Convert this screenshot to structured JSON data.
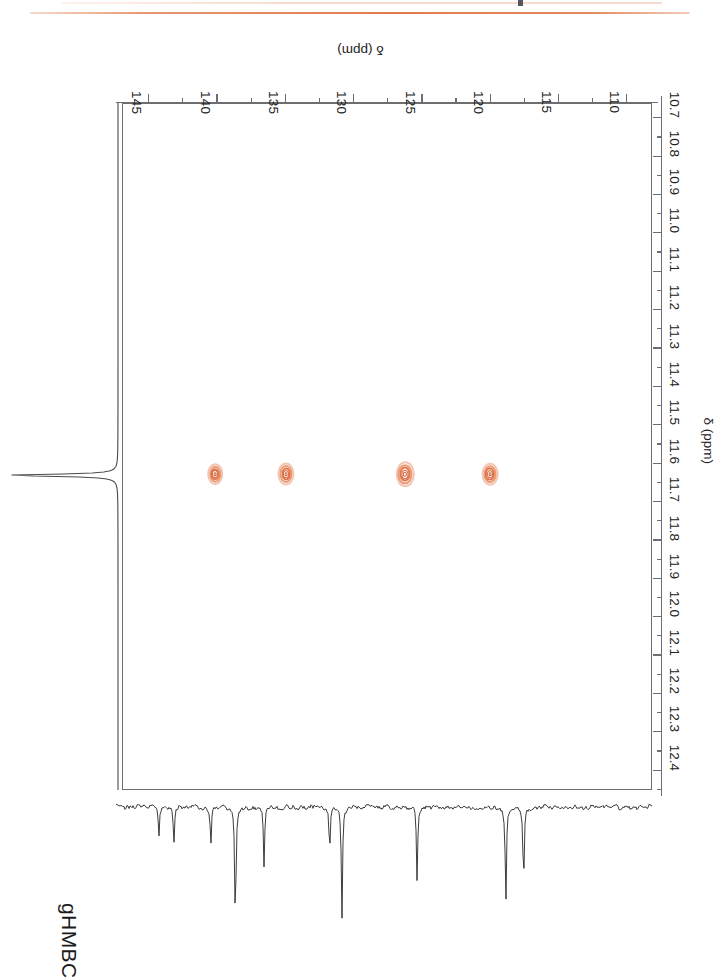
{
  "document": {
    "orientation_note": "page content printed rotated 180 degrees",
    "header_rule_color": "#e07c4e"
  },
  "figure": {
    "experiment_label": "gHMBC",
    "type": "2D NMR contour spectrum (HMBC)"
  },
  "chart_data": {
    "type": "scatter",
    "title": "gHMBC",
    "subtitle": "",
    "xlabel": "δ (ppm)",
    "ylabel": "δ (ppm)",
    "x_axis": {
      "name": "carbon-13 chemical shift",
      "label": "δ (ppm)",
      "position": "top",
      "direction": "decreasing-left-to-right-after-rotation",
      "range": [
        108.2,
        147.0
      ],
      "major_ticks": [
        110,
        115,
        120,
        125,
        130,
        135,
        140,
        145
      ],
      "tick_labels": [
        "110",
        "115",
        "120",
        "125",
        "130",
        "135",
        "140",
        "145"
      ],
      "minor_tick_step": 2.5
    },
    "y_axis": {
      "name": "proton chemical shift",
      "label": "δ (ppm)",
      "position": "right",
      "range": [
        10.66,
        12.45
      ],
      "major_ticks": [
        10.7,
        10.8,
        10.9,
        11.0,
        11.1,
        11.2,
        11.3,
        11.4,
        11.5,
        11.6,
        11.7,
        11.8,
        11.9,
        12.0,
        12.1,
        12.2,
        12.3,
        12.4
      ],
      "tick_labels": [
        "10.7",
        "10.8",
        "10.9",
        "11.0",
        "11.1",
        "11.2",
        "11.3",
        "11.4",
        "11.5",
        "11.6",
        "11.7",
        "11.8",
        "11.9",
        "12.0",
        "12.1",
        "12.2",
        "12.3",
        "12.4"
      ],
      "minor_tick_step": 0.05,
      "axis_title_near": "11.6"
    },
    "grid": false,
    "legend": false,
    "contour_color": "#e2764a",
    "cross_peaks": [
      {
        "label": "peak-1",
        "carbon_ppm": 120.0,
        "proton_ppm": 11.63,
        "intensity": 0.62
      },
      {
        "label": "peak-2",
        "carbon_ppm": 126.2,
        "proton_ppm": 11.63,
        "intensity": 1.0
      },
      {
        "label": "peak-3",
        "carbon_ppm": 134.9,
        "proton_ppm": 11.63,
        "intensity": 0.55
      },
      {
        "label": "peak-4",
        "carbon_ppm": 140.1,
        "proton_ppm": 11.63,
        "intensity": 0.48
      }
    ],
    "proton_projection": {
      "description": "1D 1H trace along the proton axis, single sharp signal",
      "peaks_ppm": [
        11.63
      ]
    },
    "carbon_trace": {
      "description": "1D 13C trace along the carbon axis with noise baseline and negative-going lines",
      "peaks_ppm": [
        117.6,
        118.9,
        125.4,
        130.9,
        131.8,
        136.6,
        138.7,
        140.5,
        143.2,
        144.3
      ]
    }
  },
  "axis_labels": {
    "carbon_title": "δ (ppm)",
    "proton_title": "δ (ppm)",
    "carbon_ticks": [
      "110",
      "115",
      "120",
      "125",
      "130",
      "135",
      "140",
      "145"
    ],
    "proton_ticks": [
      "10.7",
      "10.8",
      "10.9",
      "11.0",
      "11.1",
      "11.2",
      "11.3",
      "11.4",
      "11.5",
      "11.6",
      "11.7",
      "11.8",
      "11.9",
      "12.0",
      "12.1",
      "12.2",
      "12.3",
      "12.4"
    ]
  }
}
